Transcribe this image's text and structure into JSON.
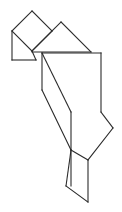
{
  "figure": {
    "type": "line-drawing",
    "canvas": {
      "width": 122,
      "height": 212
    },
    "colors": {
      "background": "#ffffff",
      "stroke": "#2b2b2b"
    },
    "stroke_width": 1.1,
    "pieces": [
      {
        "name": "square-top-left",
        "shape": "square",
        "points": "12,31 32,11 52,31 32,51"
      },
      {
        "name": "small-triangle-upper-left",
        "shape": "triangle",
        "points": "12,31 32,51 12,60"
      },
      {
        "name": "parallelogram-left-base",
        "shape": "quadrilateral",
        "points": "12,60 12,31 32,51 36,60"
      },
      {
        "name": "large-triangle-upper-right",
        "shape": "triangle",
        "points": "32,51 61,22 91,52"
      },
      {
        "name": "medium-triangle-right-block",
        "shape": "triangle",
        "points": "42,53 101,53 71,112"
      },
      {
        "name": "rectangle-right-upper",
        "shape": "quadrilateral",
        "points": "42,53 101,53 101,112 71,112"
      },
      {
        "name": "parallelogram-middle",
        "shape": "quadrilateral",
        "points": "42,53 42,90 71,112 71,150"
      },
      {
        "name": "large-triangle-lower-right",
        "shape": "triangle",
        "points": "71,112 113,128 71,170"
      },
      {
        "name": "small-triangle-bottom",
        "shape": "triangle",
        "points": "88,160 88,202 66,186"
      }
    ],
    "segments": [
      {
        "name": "square-top-left-upper-edge",
        "x1": 12,
        "y1": 31,
        "x2": 32,
        "y2": 11
      },
      {
        "name": "square-top-right-upper-edge",
        "x1": 32,
        "y1": 11,
        "x2": 52,
        "y2": 31
      },
      {
        "name": "square-lower-right-edge",
        "x1": 52,
        "y1": 31,
        "x2": 32,
        "y2": 51
      },
      {
        "name": "square-lower-left-edge",
        "x1": 32,
        "y1": 51,
        "x2": 12,
        "y2": 31
      },
      {
        "name": "left-vertical-edge",
        "x1": 12,
        "y1": 31,
        "x2": 12,
        "y2": 60
      },
      {
        "name": "left-base-horizontal-edge",
        "x1": 12,
        "y1": 60,
        "x2": 36,
        "y2": 60
      },
      {
        "name": "left-base-diagonal-edge",
        "x1": 36,
        "y1": 60,
        "x2": 32,
        "y2": 51
      },
      {
        "name": "big-triangle-left-edge",
        "x1": 32,
        "y1": 51,
        "x2": 61,
        "y2": 22
      },
      {
        "name": "big-triangle-right-edge",
        "x1": 61,
        "y1": 22,
        "x2": 91,
        "y2": 52
      },
      {
        "name": "big-triangle-base-edge",
        "x1": 91,
        "y1": 52,
        "x2": 32,
        "y2": 52
      },
      {
        "name": "upper-block-top-edge",
        "x1": 42,
        "y1": 53,
        "x2": 101,
        "y2": 53
      },
      {
        "name": "upper-block-right-edge",
        "x1": 101,
        "y1": 53,
        "x2": 101,
        "y2": 112
      },
      {
        "name": "upper-block-diagonal-edge",
        "x1": 42,
        "y1": 53,
        "x2": 71,
        "y2": 112
      },
      {
        "name": "middle-left-vertical-edge",
        "x1": 42,
        "y1": 53,
        "x2": 42,
        "y2": 90
      },
      {
        "name": "middle-parallelogram-diagonal",
        "x1": 42,
        "y1": 90,
        "x2": 71,
        "y2": 150
      },
      {
        "name": "middle-right-vertical-edge",
        "x1": 71,
        "y1": 112,
        "x2": 71,
        "y2": 150
      },
      {
        "name": "lower-triangle-upper-edge",
        "x1": 101,
        "y1": 112,
        "x2": 113,
        "y2": 128
      },
      {
        "name": "lower-triangle-right-edge",
        "x1": 113,
        "y1": 128,
        "x2": 88,
        "y2": 160
      },
      {
        "name": "lower-triangle-left-edge",
        "x1": 88,
        "y1": 160,
        "x2": 71,
        "y2": 150
      },
      {
        "name": "bottom-triangle-right-vertical",
        "x1": 88,
        "y1": 160,
        "x2": 88,
        "y2": 202
      },
      {
        "name": "bottom-triangle-lower-edge",
        "x1": 88,
        "y1": 202,
        "x2": 66,
        "y2": 186
      },
      {
        "name": "bottom-triangle-upper-edge",
        "x1": 66,
        "y1": 186,
        "x2": 71,
        "y2": 150
      },
      {
        "name": "bottom-left-vertical-edge",
        "x1": 71,
        "y1": 150,
        "x2": 71,
        "y2": 186
      }
    ]
  }
}
